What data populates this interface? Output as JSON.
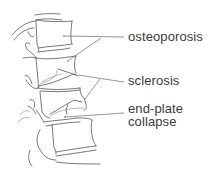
{
  "diagram": {
    "labels": [
      {
        "id": "osteoporosis",
        "text": "osteoporosis"
      },
      {
        "id": "sclerosis",
        "text": "sclerosis"
      },
      {
        "id": "end-plate-collapse",
        "line1": "end-plate",
        "line2": "collapse"
      }
    ],
    "colors": {
      "line": "#555555",
      "text": "#3a3a3a",
      "background": "#ffffff"
    }
  }
}
